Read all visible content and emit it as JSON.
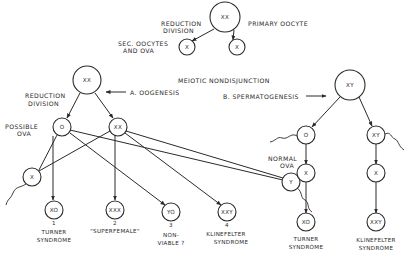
{
  "top": {
    "primary_oocyte_label": "PRIMARY OOCYTE",
    "primary_node": "XX",
    "reduction_label_1": "REDUCTION",
    "reduction_label_2": "DIVISION",
    "secondary_label_1": "SEC. OOCYTES",
    "secondary_label_2": "AND OVA",
    "secondary_nodes": [
      "X",
      "X"
    ]
  },
  "heading": "MEIOTIC NONDISJUNCTION",
  "oogenesis": {
    "section_label": "A. OOGENESIS",
    "reduction_label_1": "REDUCTION",
    "reduction_label_2": "DIVISION",
    "parent_node": "XX",
    "possible_ova_label_1": "POSSIBLE",
    "possible_ova_label_2": "OVA",
    "ova_nodes": [
      "O",
      "XX"
    ],
    "sperm_nodes": [
      "X",
      "Y"
    ],
    "outcomes": [
      {
        "node": "XO",
        "number": "1",
        "line1": "TURNER",
        "line2": "SYNDROME"
      },
      {
        "node": "XXX",
        "number": "2",
        "line1": "\"SUPERFEMALE\"",
        "line2": ""
      },
      {
        "node": "YO",
        "number": "3",
        "line1": "NON-",
        "line2": "VIABLE ?"
      },
      {
        "node": "XXY",
        "number": "4",
        "line1": "KLINEFELTER",
        "line2": "SYNDROME"
      }
    ]
  },
  "spermatogenesis": {
    "section_label": "B. SPERMATOGENESIS",
    "parent_node": "XY",
    "sperm_nodes": [
      "O",
      "XY"
    ],
    "normal_ova_label_1": "NORMAL",
    "normal_ova_label_2": "OVA",
    "ova_nodes": [
      "X",
      "X"
    ],
    "outcomes": [
      {
        "node": "XO",
        "line1": "TURNER",
        "line2": "SYNDROME"
      },
      {
        "node": "XXY",
        "line1": "KLINEFELTER",
        "line2": "SYNDROME"
      }
    ]
  }
}
